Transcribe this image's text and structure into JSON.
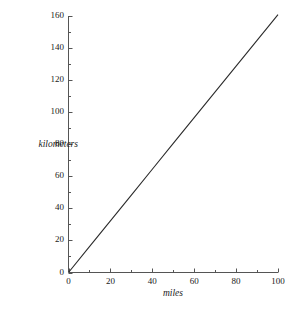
{
  "chart_data": {
    "type": "line",
    "title": "",
    "subtitle": "",
    "xlabel": "miles",
    "ylabel": "kilometers",
    "xlim": [
      0,
      100
    ],
    "ylim": [
      0,
      160
    ],
    "grid": false,
    "legend": null,
    "x_ticks": [
      0,
      20,
      40,
      60,
      80,
      100
    ],
    "x_tick_labels": [
      "0",
      "20",
      "40",
      "60",
      "80",
      "100"
    ],
    "x_minor_step": 10,
    "y_ticks": [
      0,
      20,
      40,
      60,
      80,
      100,
      120,
      140,
      160
    ],
    "y_tick_labels": [
      "0",
      "20",
      "40",
      "60",
      "80",
      "100",
      "120",
      "140",
      "160"
    ],
    "y_minor_step": 10,
    "series": [
      {
        "name": "miles to kilometers",
        "color": "#2b2b2b",
        "x": [
          0,
          10,
          20,
          30,
          40,
          50,
          60,
          70,
          80,
          90,
          100
        ],
        "values": [
          0,
          16.1,
          32.2,
          48.3,
          64.4,
          80.5,
          96.6,
          112.7,
          128.7,
          144.8,
          160.9
        ]
      }
    ],
    "annotations": []
  },
  "axes": {
    "x_label": "miles",
    "y_label": "kilometers",
    "x_tick_labels": [
      "0",
      "20",
      "40",
      "60",
      "80",
      "100"
    ],
    "y_tick_labels": [
      "0",
      "20",
      "40",
      "60",
      "80",
      "100",
      "120",
      "140",
      "160"
    ]
  },
  "colors": {
    "line": "#2b2b2b",
    "axis": "#555555",
    "text": "#1a1a1a",
    "background": "#ffffff"
  }
}
